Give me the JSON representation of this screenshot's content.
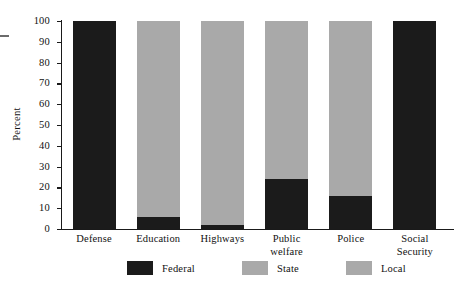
{
  "chart_data": {
    "type": "bar",
    "subtype": "stacked-bar-100-percent",
    "title": "",
    "xlabel": "",
    "ylabel": "Percent",
    "ylim": [
      0,
      100
    ],
    "ytick_labels": [
      "0",
      "10",
      "20",
      "30",
      "40",
      "50",
      "60",
      "70",
      "80",
      "90",
      "100"
    ],
    "ytick_values": [
      0,
      10,
      20,
      30,
      40,
      50,
      60,
      70,
      80,
      90,
      100
    ],
    "grid": false,
    "legend_position": "bottom-center",
    "categories": [
      "Defense",
      "Education",
      "Highways",
      "Public\nwelfare",
      "Police",
      "Social\nSecurity"
    ],
    "series": [
      {
        "name": "Federal",
        "color": "#1b1b1b",
        "values": [
          100,
          6,
          2,
          24,
          16,
          100
        ]
      },
      {
        "name": "State",
        "color": "#a9a9a9",
        "values": [
          0,
          94,
          98,
          76,
          84,
          0
        ]
      },
      {
        "name": "Local",
        "color": "#a9a9a9",
        "values": [
          0,
          0,
          0,
          0,
          0,
          0
        ]
      }
    ]
  },
  "legend": {
    "items": [
      {
        "label": "Federal",
        "color": "#1b1b1b"
      },
      {
        "label": "State",
        "color": "#a9a9a9"
      },
      {
        "label": "Local",
        "color": "#a9a9a9"
      }
    ]
  },
  "axis": {
    "y_title": "Percent"
  }
}
